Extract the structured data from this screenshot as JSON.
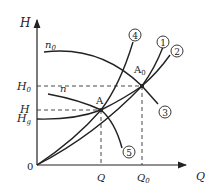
{
  "axes": {
    "y_label": "H",
    "x_label": "Q",
    "origin_label": "0"
  },
  "y_ticks": {
    "H0": "H",
    "H0_sub": "0",
    "H": "H",
    "Hg": "H",
    "Hg_sub": "g"
  },
  "x_ticks": {
    "Q": "Q",
    "Q0": "Q",
    "Q0_sub": "0"
  },
  "points": {
    "A": "A",
    "A0": "A",
    "A0_sub": "0"
  },
  "curve_labels": {
    "n0": "n",
    "n0_sub": "0",
    "n": "n"
  },
  "circled_numbers": [
    "1",
    "2",
    "3",
    "4",
    "5"
  ],
  "colors": {
    "line": "#222222",
    "background": "#ffffff"
  }
}
